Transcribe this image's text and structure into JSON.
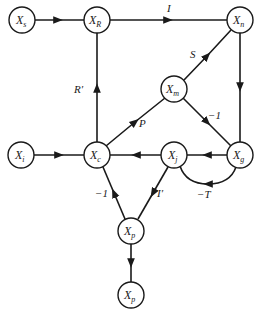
{
  "diagram": {
    "type": "signal-flow-graph",
    "nodes": [
      {
        "id": "xs",
        "base": "X",
        "sub": "s",
        "x": 22,
        "y": 20
      },
      {
        "id": "xr",
        "base": "X",
        "sub": "R",
        "x": 97,
        "y": 20
      },
      {
        "id": "xn",
        "base": "X",
        "sub": "n",
        "x": 240,
        "y": 20
      },
      {
        "id": "xm",
        "base": "X",
        "sub": "m",
        "x": 174,
        "y": 89
      },
      {
        "id": "xi",
        "base": "X",
        "sub": "i",
        "x": 21,
        "y": 155
      },
      {
        "id": "xc",
        "base": "X",
        "sub": "c",
        "x": 97,
        "y": 155
      },
      {
        "id": "xj",
        "base": "X",
        "sub": "j",
        "x": 174,
        "y": 155
      },
      {
        "id": "xg",
        "base": "X",
        "sub": "g",
        "x": 240,
        "y": 155
      },
      {
        "id": "xp1",
        "base": "X",
        "sub": "p",
        "x": 131,
        "y": 231
      },
      {
        "id": "xp2",
        "base": "X",
        "sub": "p",
        "x": 131,
        "y": 295
      }
    ],
    "edges": [
      {
        "from": "xs",
        "to": "xr",
        "label": ""
      },
      {
        "from": "xr",
        "to": "xn",
        "label": "I"
      },
      {
        "from": "xn",
        "to": "xg",
        "label": ""
      },
      {
        "from": "xm",
        "to": "xn",
        "label": "S"
      },
      {
        "from": "xc",
        "to": "xr",
        "label": "R′"
      },
      {
        "from": "xc",
        "to": "xm",
        "label": "P"
      },
      {
        "from": "xm",
        "to": "xg",
        "label": "−1"
      },
      {
        "from": "xi",
        "to": "xc",
        "label": ""
      },
      {
        "from": "xg",
        "to": "xj",
        "label": ""
      },
      {
        "from": "xg",
        "to": "xj",
        "label": "−T",
        "curved": true
      },
      {
        "from": "xj",
        "to": "xc",
        "label": ""
      },
      {
        "from": "xp1",
        "to": "xc",
        "label": "−1"
      },
      {
        "from": "xj",
        "to": "xp1",
        "label": "I′"
      },
      {
        "from": "xp1",
        "to": "xp2",
        "label": ""
      }
    ],
    "labels": {
      "I": "I",
      "S": "S",
      "R_prime": "R′",
      "P": "P",
      "minus_one_mg": "−1",
      "minus_T": "−T",
      "minus_one_pc": "−1",
      "I_prime": "I′"
    },
    "node_base": "X",
    "node_subs": {
      "xs": "s",
      "xr": "R",
      "xn": "n",
      "xm": "m",
      "xi": "i",
      "xc": "c",
      "xj": "j",
      "xg": "g",
      "xp1": "p",
      "xp2": "p"
    }
  }
}
